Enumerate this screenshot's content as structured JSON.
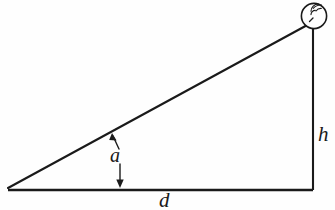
{
  "figure": {
    "type": "geometry-diagram",
    "background_color": "#fefefe",
    "stroke_color": "#1a1a1a"
  },
  "labels": {
    "height": "h",
    "distance": "d",
    "angle": "a"
  },
  "icons": {
    "transmitter": "radio-antenna-icon"
  },
  "geometry": {
    "base_left_x": 8,
    "base_right_x": 313,
    "base_y": 190,
    "apex_x": 313,
    "apex_y": 22,
    "transmitter_center_x": 314,
    "transmitter_center_y": 16,
    "transmitter_radius": 13,
    "angle_marker_x": 117,
    "angle_arrow_top_y": 134,
    "angle_arrow_bottom_y": 188
  }
}
